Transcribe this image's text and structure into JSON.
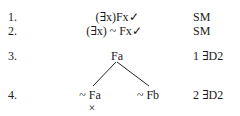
{
  "proof": {
    "rows": [
      {
        "number": "1.",
        "formula": "(∃x)Fx✓",
        "justification": "SM"
      },
      {
        "number": "2.",
        "formula": "(∃x) ~ Fx✓",
        "justification": "SM"
      },
      {
        "number": "3.",
        "formula": "Fa",
        "justification": "1 ∃D2"
      },
      {
        "number": "4.",
        "left_branch": "~ Fa",
        "right_branch": "~ Fb",
        "justification": "2 ∃D2"
      }
    ],
    "closed_marker": "×"
  }
}
